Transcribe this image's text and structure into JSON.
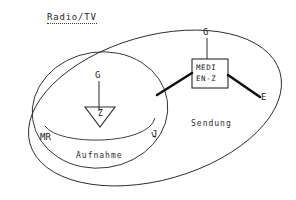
{
  "figure": {
    "title": "Radio/TV",
    "kind": "venn-diagram",
    "ink_color": "#1a1a1a",
    "background_color": "#ffffff",
    "regions": [
      {
        "id": "outer",
        "label": "",
        "shape": "ellipse-tilted"
      },
      {
        "id": "aufnahme",
        "label": "Aufnahme",
        "shape": "ellipse"
      },
      {
        "id": "sendung",
        "label": "Sendung",
        "shape": "region"
      }
    ],
    "nodes": [
      {
        "id": "medienzentrale",
        "line1": "MEDI",
        "line2": "EN-Z",
        "shape": "rectangle"
      },
      {
        "id": "zentrale",
        "label": "Z",
        "shape": "triangle-down"
      }
    ],
    "endpoint_labels": [
      {
        "id": "g-top",
        "label": "G"
      },
      {
        "id": "g-zentrale",
        "label": "G"
      },
      {
        "id": "e-right",
        "label": "E"
      },
      {
        "id": "mr-left",
        "label": "MR"
      },
      {
        "id": "j-right",
        "label": "J"
      }
    ]
  }
}
